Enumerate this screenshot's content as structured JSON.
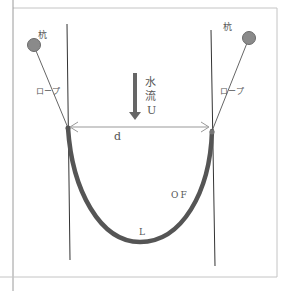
{
  "diagram": {
    "type": "fence-net-schematic",
    "labels": {
      "pile_left": "杭",
      "pile_right": "杭",
      "rope_left": "ロープ",
      "rope_right": "ロープ",
      "flow_line1": "水",
      "flow_line2": "流",
      "flow_line3": "U",
      "distance": "d",
      "fence": "OF",
      "length": "L"
    },
    "colors": {
      "frame": "#bbbbbb",
      "pile": "#8a8a8a",
      "pile_stroke": "#6a6a6a",
      "line": "#444444",
      "net": "#555555",
      "arrow": "#666666",
      "text": "#555555"
    }
  }
}
